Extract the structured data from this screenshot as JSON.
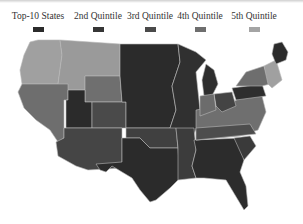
{
  "legend": {
    "items": [
      {
        "label": "Top-10 States",
        "color": "#2b2b2b"
      },
      {
        "label": "2nd Quintile",
        "color": "#363636"
      },
      {
        "label": "3rd Quintile",
        "color": "#4a4a4a"
      },
      {
        "label": "4th Quintile",
        "color": "#6e6e6e"
      },
      {
        "label": "5th Quintile",
        "color": "#a4a4a4"
      }
    ]
  },
  "map": {
    "title": "US states by quintile",
    "regions": [
      {
        "name": "pacific-northwest",
        "quintile": "5th Quintile"
      },
      {
        "name": "mountain-north",
        "quintile": "5th Quintile"
      },
      {
        "name": "great-plains-north",
        "quintile": "Top-10 States"
      },
      {
        "name": "midwest",
        "quintile": "Top-10 States"
      },
      {
        "name": "california-nevada",
        "quintile": "4th Quintile"
      },
      {
        "name": "utah",
        "quintile": "Top-10 States"
      },
      {
        "name": "colorado-wyoming",
        "quintile": "3rd Quintile"
      },
      {
        "name": "southwest",
        "quintile": "3rd Quintile"
      },
      {
        "name": "texas",
        "quintile": "Top-10 States"
      },
      {
        "name": "southeast",
        "quintile": "Top-10 States"
      },
      {
        "name": "appalachia",
        "quintile": "4th Quintile"
      },
      {
        "name": "new-england",
        "quintile": "5th Quintile"
      },
      {
        "name": "maine",
        "quintile": "Top-10 States"
      }
    ]
  }
}
